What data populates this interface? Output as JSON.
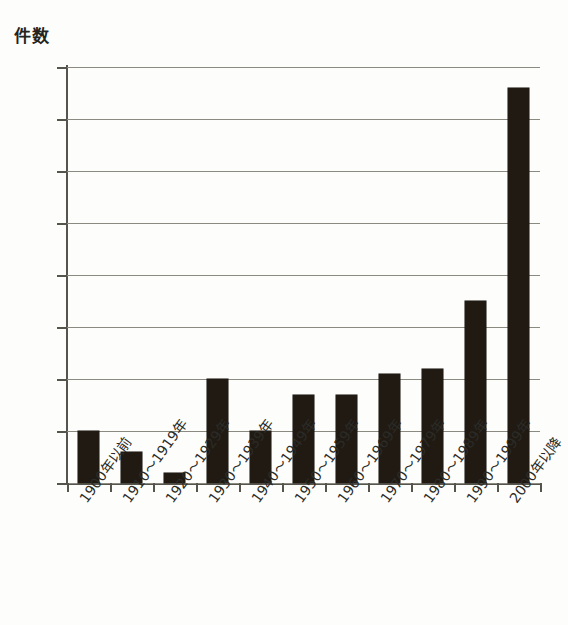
{
  "chart_data": {
    "type": "bar",
    "title": "",
    "subtitle": "",
    "xlabel": "",
    "ylabel": "件数",
    "ylim": [
      0,
      80
    ],
    "ytick_step": 10,
    "yticks": [
      80,
      70,
      60,
      50,
      40,
      30,
      20,
      10,
      0
    ],
    "grid": true,
    "legend": false,
    "bar_color": "#201a13",
    "gridline_color": "#8a8a80",
    "axis_color": "#55554e",
    "background_color": "#fdfdfb",
    "categories": [
      "1900年以前",
      "1910～1919年",
      "1920～1929年",
      "1930～1939年",
      "1940～1949年",
      "1950～1959年",
      "1960～1969年",
      "1970～1979年",
      "1980～1989年",
      "1990～1999年",
      "2000年以降"
    ],
    "values": [
      10,
      6,
      2,
      20,
      10,
      17,
      17,
      21,
      22,
      35,
      76
    ]
  }
}
